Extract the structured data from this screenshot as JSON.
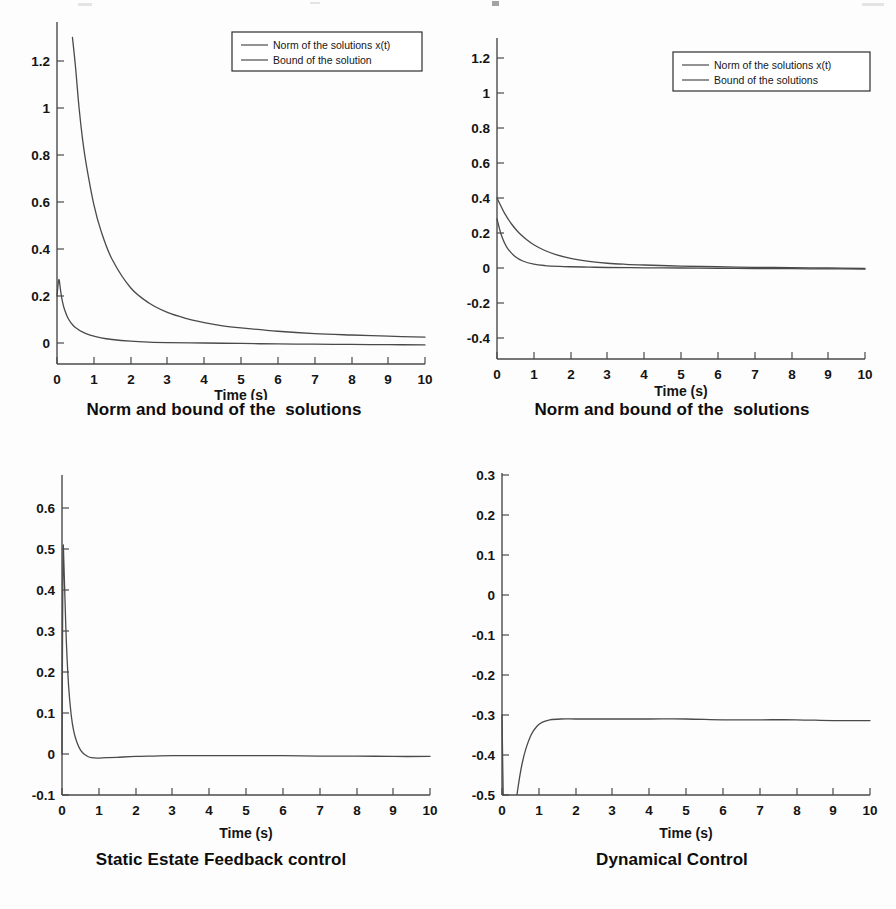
{
  "figure": {
    "panel_count": 4,
    "layout": "2x2",
    "line_color": "#4a4a4a",
    "text_color": "#141414",
    "background": "#fdfdfd"
  },
  "chart_data": [
    {
      "id": "panel-1",
      "type": "line",
      "title": "Norm and bound of the  solutions",
      "xlabel": "Time (s)",
      "ylabel": "",
      "xlim": [
        0,
        10
      ],
      "ylim": [
        0,
        1.3
      ],
      "xticks": [
        0,
        1,
        2,
        3,
        4,
        5,
        6,
        7,
        8,
        9,
        10
      ],
      "xticklabels": [
        "0",
        "1",
        "2",
        "3",
        "4",
        "5",
        "6",
        "7",
        "8",
        "9",
        "10"
      ],
      "yticks": [
        0,
        0.2,
        0.4,
        0.6,
        0.8,
        1,
        1.2
      ],
      "yticklabels": [
        "0",
        "0.2",
        "0.4",
        "0.6",
        "0.8",
        "1",
        "1.2"
      ],
      "grid": false,
      "legend_position": "upper-center-right",
      "series": [
        {
          "name": "Norm of the solutions x(t)",
          "x": [
            0,
            0.05,
            0.1,
            0.15,
            0.2,
            0.3,
            0.4,
            0.5,
            0.7,
            0.9,
            1.2,
            1.5,
            2,
            2.5,
            3,
            4,
            5,
            6,
            7,
            8,
            9,
            10
          ],
          "y": [
            0.2,
            0.27,
            0.22,
            0.175,
            0.145,
            0.105,
            0.082,
            0.066,
            0.046,
            0.034,
            0.022,
            0.015,
            0.008,
            0.004,
            0.002,
            0.0,
            -0.002,
            -0.004,
            -0.005,
            -0.006,
            -0.007,
            -0.008
          ]
        },
        {
          "name": "Bound of the solution",
          "x": [
            0.42,
            0.5,
            0.6,
            0.7,
            0.8,
            1,
            1.2,
            1.5,
            2,
            2.5,
            3,
            3.5,
            4,
            4.5,
            5,
            6,
            7,
            8,
            9,
            10
          ],
          "y": [
            1.3,
            1.18,
            1.0,
            0.86,
            0.755,
            0.59,
            0.475,
            0.355,
            0.235,
            0.17,
            0.13,
            0.105,
            0.087,
            0.073,
            0.064,
            0.05,
            0.04,
            0.034,
            0.029,
            0.025
          ]
        }
      ]
    },
    {
      "id": "panel-2",
      "type": "line",
      "title": "Norm and bound of the  solutions",
      "xlabel": "Time (s)",
      "ylabel": "",
      "xlim": [
        0,
        10
      ],
      "ylim": [
        -0.4,
        1.2
      ],
      "xticks": [
        0,
        1,
        2,
        3,
        4,
        5,
        6,
        7,
        8,
        9,
        10
      ],
      "xticklabels": [
        "0",
        "1",
        "2",
        "3",
        "4",
        "5",
        "6",
        "7",
        "8",
        "9",
        "10"
      ],
      "yticks": [
        -0.4,
        -0.2,
        0,
        0.2,
        0.4,
        0.6,
        0.8,
        1,
        1.2
      ],
      "yticklabels": [
        "-0.4",
        "-0.2",
        "0",
        "0.2",
        "0.4",
        "0.6",
        "0.8",
        "1",
        "1.2"
      ],
      "grid": false,
      "legend_position": "upper-right",
      "series": [
        {
          "name": "Norm of the solutions x(t)",
          "x": [
            0,
            0.1,
            0.2,
            0.3,
            0.5,
            0.7,
            1,
            1.3,
            1.7,
            2,
            2.5,
            3,
            4,
            5,
            6,
            7,
            8,
            9,
            10
          ],
          "y": [
            0.28,
            0.2,
            0.145,
            0.108,
            0.064,
            0.04,
            0.022,
            0.014,
            0.009,
            0.007,
            0.005,
            0.003,
            0.001,
            0.0,
            -0.002,
            -0.003,
            -0.004,
            -0.005,
            -0.006
          ]
        },
        {
          "name": "Bound of the  solutions",
          "x": [
            0,
            0.2,
            0.4,
            0.6,
            0.8,
            1,
            1.3,
            1.6,
            2,
            2.5,
            3,
            3.5,
            4,
            5,
            6,
            7,
            8,
            9,
            10
          ],
          "y": [
            0.4,
            0.315,
            0.25,
            0.2,
            0.163,
            0.133,
            0.1,
            0.077,
            0.055,
            0.038,
            0.027,
            0.021,
            0.017,
            0.011,
            0.007,
            0.004,
            0.002,
            0.0,
            -0.003
          ]
        }
      ]
    },
    {
      "id": "panel-3",
      "type": "line",
      "title": "Static Estate Feedback control",
      "xlabel": "Time (s)",
      "ylabel": "",
      "xlim": [
        0,
        10
      ],
      "ylim": [
        -0.1,
        0.68
      ],
      "xticks": [
        0,
        1,
        2,
        3,
        4,
        5,
        6,
        7,
        8,
        9,
        10
      ],
      "xticklabels": [
        "0",
        "1",
        "2",
        "3",
        "4",
        "5",
        "6",
        "7",
        "8",
        "9",
        "10"
      ],
      "yticks": [
        -0.1,
        0,
        0.1,
        0.2,
        0.3,
        0.4,
        0.5,
        0.6
      ],
      "yticklabels": [
        "-0.1",
        "0",
        "0.1",
        "0.2",
        "0.3",
        "0.4",
        "0.5",
        "0.6"
      ],
      "grid": false,
      "legend_position": "none",
      "series": [
        {
          "name": "control signal",
          "x": [
            0,
            0.015,
            0.03,
            0.05,
            0.08,
            0.12,
            0.18,
            0.25,
            0.32,
            0.4,
            0.5,
            0.6,
            0.7,
            0.8,
            0.95,
            1.2,
            1.5,
            2,
            2.5,
            3,
            4,
            5,
            6,
            7,
            8,
            9,
            10
          ],
          "y": [
            0.0,
            0.3,
            0.5,
            0.47,
            0.38,
            0.27,
            0.165,
            0.095,
            0.055,
            0.03,
            0.01,
            0.0,
            -0.006,
            -0.009,
            -0.01,
            -0.009,
            -0.008,
            -0.006,
            -0.005,
            -0.004,
            -0.004,
            -0.004,
            -0.004,
            -0.005,
            -0.005,
            -0.006,
            -0.006
          ]
        }
      ]
    },
    {
      "id": "panel-4",
      "type": "line",
      "title": "Dynamical Control",
      "xlabel": "Time (s)",
      "ylabel": "",
      "xlim": [
        0,
        10
      ],
      "ylim": [
        -0.5,
        0.3
      ],
      "xticks": [
        0,
        1,
        2,
        3,
        4,
        5,
        6,
        7,
        8,
        9,
        10
      ],
      "xticklabels": [
        "0",
        "1",
        "2",
        "3",
        "4",
        "5",
        "6",
        "7",
        "8",
        "9",
        "10"
      ],
      "yticks": [
        -0.5,
        -0.4,
        -0.3,
        -0.2,
        -0.1,
        0,
        0.1,
        0.2,
        0.3
      ],
      "yticklabels": [
        "-0.5",
        "-0.4",
        "-0.3",
        "-0.2",
        "-0.1",
        "0",
        "0.1",
        "0.2",
        "0.3"
      ],
      "grid": false,
      "legend_position": "none",
      "series": [
        {
          "name": "control signal",
          "x": [
            0,
            0.04,
            0.08,
            0.12,
            0.16,
            0.2,
            0.25,
            0.3,
            0.38,
            0.45,
            0.55,
            0.65,
            0.8,
            0.95,
            1.1,
            1.3,
            1.6,
            2,
            2.5,
            3,
            4,
            5,
            6,
            7,
            8,
            9,
            10
          ],
          "y": [
            0.0,
            -0.12,
            -0.19,
            -0.21,
            -0.208,
            -0.195,
            -0.17,
            -0.145,
            -0.11,
            -0.086,
            -0.06,
            -0.042,
            -0.024,
            -0.014,
            -0.009,
            -0.006,
            -0.005,
            -0.005,
            -0.005,
            -0.005,
            -0.005,
            -0.005,
            -0.006,
            -0.006,
            -0.006,
            -0.007,
            -0.007
          ]
        }
      ]
    }
  ]
}
